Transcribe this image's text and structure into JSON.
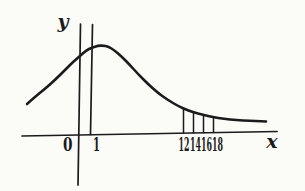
{
  "figure": {
    "background": "#fbfbf8",
    "ink": "#1b1b1b",
    "kind": "hand-drawn distribution sketch"
  },
  "chart_data": {
    "type": "line",
    "xlabel": "x",
    "ylabel": "y",
    "origin_tick": "0",
    "unit_tick": "1",
    "tail_ticks": [
      "12",
      "14",
      "16",
      "18"
    ],
    "legend": false,
    "grid": false,
    "layout_hints": {
      "x_axis_not_to_scale": true,
      "peak_near_x": 1,
      "unit_line_at_x": 1,
      "tail_strips_between_x": [
        12,
        14,
        16,
        18
      ],
      "y_axis_extends_below_x_axis": true
    },
    "geometry_px": {
      "x_axis": [
        [
          22,
          136
        ],
        [
          277,
          131.5
        ]
      ],
      "y_axis": [
        [
          80.5,
          24
        ],
        [
          78,
          185
        ]
      ],
      "unit_line": [
        [
          92.5,
          24.5
        ],
        [
          90.5,
          134.5
        ]
      ],
      "curve": [
        [
          27,
          104
        ],
        [
          36,
          96
        ],
        [
          46,
          88
        ],
        [
          56,
          79
        ],
        [
          65,
          70
        ],
        [
          73,
          62
        ],
        [
          80,
          56
        ],
        [
          86,
          50.5
        ],
        [
          92,
          47.5
        ],
        [
          98,
          45.8
        ],
        [
          103,
          45.5
        ],
        [
          108,
          46.5
        ],
        [
          114,
          50
        ],
        [
          121,
          56
        ],
        [
          129,
          64
        ],
        [
          138,
          74
        ],
        [
          148,
          84
        ],
        [
          158,
          93
        ],
        [
          168,
          100
        ],
        [
          178,
          106
        ],
        [
          188,
          110.5
        ],
        [
          198,
          113.5
        ],
        [
          208,
          116
        ],
        [
          218,
          118
        ],
        [
          230,
          119.5
        ],
        [
          243,
          120.5
        ],
        [
          256,
          121
        ],
        [
          266,
          121.5
        ]
      ],
      "strip_lines_x": [
        183.5,
        193.5,
        203.5,
        213.5
      ]
    }
  }
}
